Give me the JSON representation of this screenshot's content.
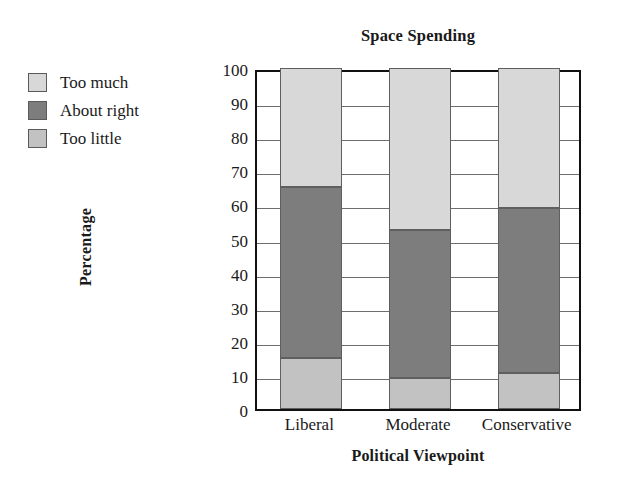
{
  "chart_data": {
    "type": "bar",
    "stacked": true,
    "title": "Space Spending",
    "xlabel": "Political Viewpoint",
    "ylabel": "Percentage",
    "categories": [
      "Liberal",
      "Moderate",
      "Conservative"
    ],
    "series": [
      {
        "name": "Too little",
        "color": "#c2c2c2",
        "values": [
          15,
          9,
          10.5
        ]
      },
      {
        "name": "About right",
        "color": "#7d7d7d",
        "values": [
          50,
          43.5,
          48.5
        ]
      },
      {
        "name": "Too much",
        "color": "#d8d8d8",
        "values": [
          35,
          47.5,
          41
        ]
      }
    ],
    "stack_order_bottom_to_top": [
      "Too little",
      "About right",
      "Too much"
    ],
    "ylim": [
      0,
      100
    ],
    "yticks": [
      0,
      10,
      20,
      30,
      40,
      50,
      60,
      70,
      80,
      90,
      100
    ],
    "ytick_labels": [
      "0",
      "10",
      "20",
      "30",
      "40",
      "50",
      "60",
      "70",
      "80",
      "90",
      "100"
    ],
    "grid": true,
    "grid_axis": "y",
    "legend_position": "outside-left-top",
    "legend_entries": [
      "Too much",
      "About right",
      "Too little"
    ],
    "segment_boundaries": {
      "Liberal": [
        0,
        15,
        65,
        100
      ],
      "Moderate": [
        0,
        9,
        52.5,
        100
      ],
      "Conservative": [
        0,
        10.5,
        59,
        100
      ]
    },
    "axis_color": "#111111",
    "gridline_color": "#6e6e6e",
    "segment_border_color": "#5f5f5f",
    "background_color": "#ffffff"
  },
  "legend": {
    "items": [
      {
        "label": "Too much",
        "color": "#d8d8d8"
      },
      {
        "label": "About right",
        "color": "#7d7d7d"
      },
      {
        "label": "Too little",
        "color": "#c2c2c2"
      }
    ]
  }
}
